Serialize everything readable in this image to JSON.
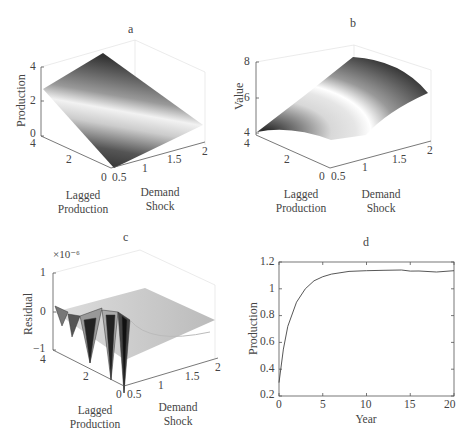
{
  "figure": {
    "panels": [
      {
        "id": "a",
        "title": "a",
        "zlabel": "Production",
        "xlabel": "Lagged\nProduction",
        "ylabel": "Demand\nShock",
        "zticks": [
          "0",
          "2",
          "4"
        ],
        "lagged_ticks": [
          "0",
          "2",
          "4"
        ],
        "shock_ticks": [
          "0.5",
          "1",
          "1.5",
          "2"
        ]
      },
      {
        "id": "b",
        "title": "b",
        "zlabel": "Value",
        "xlabel": "Lagged\nProduction",
        "ylabel": "Demand\nShock",
        "zticks": [
          "4",
          "6",
          "8"
        ],
        "lagged_ticks": [
          "0",
          "2",
          "4"
        ],
        "shock_ticks": [
          "0.5",
          "1",
          "1.5",
          "2"
        ]
      },
      {
        "id": "c",
        "title": "c",
        "zlabel": "Residual",
        "exponent": "×10⁻⁶",
        "xlabel": "Lagged\nProduction",
        "ylabel": "Demand\nShock",
        "zticks": [
          "−1",
          "0",
          "1"
        ],
        "lagged_ticks": [
          "0",
          "2",
          "4"
        ],
        "shock_ticks": [
          "0.5",
          "1",
          "1.5",
          "2"
        ]
      },
      {
        "id": "d",
        "title": "d",
        "xlabel": "Year",
        "ylabel": "Production",
        "xticks": [
          "0",
          "5",
          "10",
          "15",
          "20"
        ],
        "yticks": [
          "0.2",
          "0.4",
          "0.6",
          "0.8",
          "1",
          "1.2"
        ]
      }
    ]
  },
  "chart_data": [
    {
      "type": "surface",
      "title": "a",
      "xlabel": "Lagged Production",
      "ylabel": "Demand Shock",
      "zlabel": "Production",
      "xlim": [
        0,
        4
      ],
      "ylim": [
        0.5,
        2
      ],
      "zlim": [
        0,
        4
      ],
      "description": "Planar surface increasing with demand shock, roughly 0.3 at shock 0.5 up to ~3.5 at shock 2"
    },
    {
      "type": "surface",
      "title": "b",
      "xlabel": "Lagged Production",
      "ylabel": "Demand Shock",
      "zlabel": "Value",
      "xlim": [
        0,
        4
      ],
      "ylim": [
        0.5,
        2
      ],
      "zlim": [
        4,
        8
      ],
      "description": "Concave surface rising from ~4 at low shock to ~7.5 at high shock"
    },
    {
      "type": "surface",
      "title": "c",
      "xlabel": "Lagged Production",
      "ylabel": "Demand Shock",
      "zlabel": "Residual (×10⁻⁶)",
      "xlim": [
        0,
        4
      ],
      "ylim": [
        0.5,
        2
      ],
      "zlim": [
        -1,
        1
      ],
      "description": "Approximation residuals near zero, oscillating spikes up to ~±1e-6 at low demand shock"
    },
    {
      "type": "line",
      "title": "d",
      "xlabel": "Year",
      "ylabel": "Production",
      "xlim": [
        0,
        20
      ],
      "ylim": [
        0.2,
        1.2
      ],
      "x": [
        0,
        0.5,
        1,
        2,
        3,
        4,
        5,
        6,
        8,
        10,
        12,
        14,
        15,
        16,
        18,
        20
      ],
      "values": [
        0.3,
        0.55,
        0.72,
        0.9,
        1.0,
        1.06,
        1.09,
        1.11,
        1.13,
        1.135,
        1.138,
        1.14,
        1.132,
        1.133,
        1.125,
        1.135
      ]
    }
  ]
}
